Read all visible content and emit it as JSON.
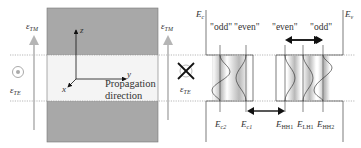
{
  "left_panel": {
    "polarization_labels": {
      "tm_left": {
        "symbol": "ε",
        "subscript": "TM"
      },
      "tm_right": {
        "symbol": "ε",
        "subscript": "TM"
      },
      "te_left": {
        "symbol": "ε",
        "subscript": "TE"
      },
      "te_right": {
        "symbol": "ε",
        "subscript": "TE"
      }
    },
    "axes": {
      "z": "z",
      "y": "y",
      "x": "x"
    },
    "propagation_line1": "Propagation",
    "propagation_line2": "direction",
    "icons": {
      "te_left": "circle-dot-out-of-plane",
      "te_right": "cross-into-plane"
    }
  },
  "band_diagram": {
    "conduction_edge": {
      "symbol": "E",
      "subscript": "c"
    },
    "valence_edge": {
      "symbol": "E",
      "subscript": "v"
    },
    "parity_labels": [
      "\"odd\"",
      "\"even\"",
      "\"even\"",
      "\"odd\""
    ],
    "levels": [
      {
        "symbol": "E",
        "subscript": "c2"
      },
      {
        "symbol": "E",
        "subscript": "c1"
      },
      {
        "symbol": "E",
        "subscript": "HH1"
      },
      {
        "symbol": "E",
        "subscript": "LH1"
      },
      {
        "symbol": "E",
        "subscript": "HH2"
      }
    ]
  },
  "colors": {
    "cladding": "#a8a8a8",
    "core": "#f4f4f4",
    "arrow": "#b5b5b5",
    "line": "#333333"
  }
}
